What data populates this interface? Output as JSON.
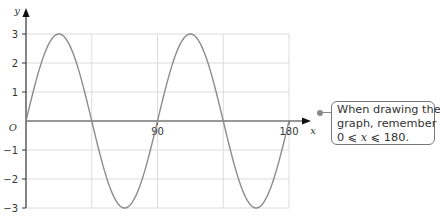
{
  "chart_data": {
    "type": "line",
    "title": "",
    "function": "y = 3 sin 4x",
    "xlabel": "x",
    "ylabel": "y",
    "xlim": [
      0,
      180
    ],
    "ylim": [
      -3,
      3
    ],
    "x_ticks_labeled": [
      90,
      180
    ],
    "x_gridlines": [
      45,
      90,
      135,
      180
    ],
    "y_ticks": [
      3,
      2,
      1,
      -1,
      -2,
      -3
    ],
    "origin_label": "O",
    "grid": true,
    "series": [
      {
        "name": "y = 3 sin 4x",
        "x": [
          0,
          22.5,
          45,
          67.5,
          90,
          112.5,
          135,
          157.5,
          180
        ],
        "values": [
          0,
          3,
          0,
          -3,
          0,
          3,
          0,
          -3,
          0
        ]
      }
    ],
    "annotations": [
      "When drawing the graph, remember 0 ≤ x ≤ 180."
    ]
  },
  "axes": {
    "y_label": "y",
    "x_label": "x",
    "origin": "O",
    "x_tick_labels": [
      "90",
      "180"
    ],
    "y_tick_labels": [
      "3",
      "2",
      "1",
      "−1",
      "−2",
      "−3"
    ]
  },
  "callout": {
    "line1": "When drawing the",
    "line2": "graph, remember",
    "line3": "0 ⩽ x ⩽ 180."
  },
  "colors": {
    "curve": "#8c8c8c",
    "grid": "#dcdcdc",
    "axis": "#333333"
  }
}
